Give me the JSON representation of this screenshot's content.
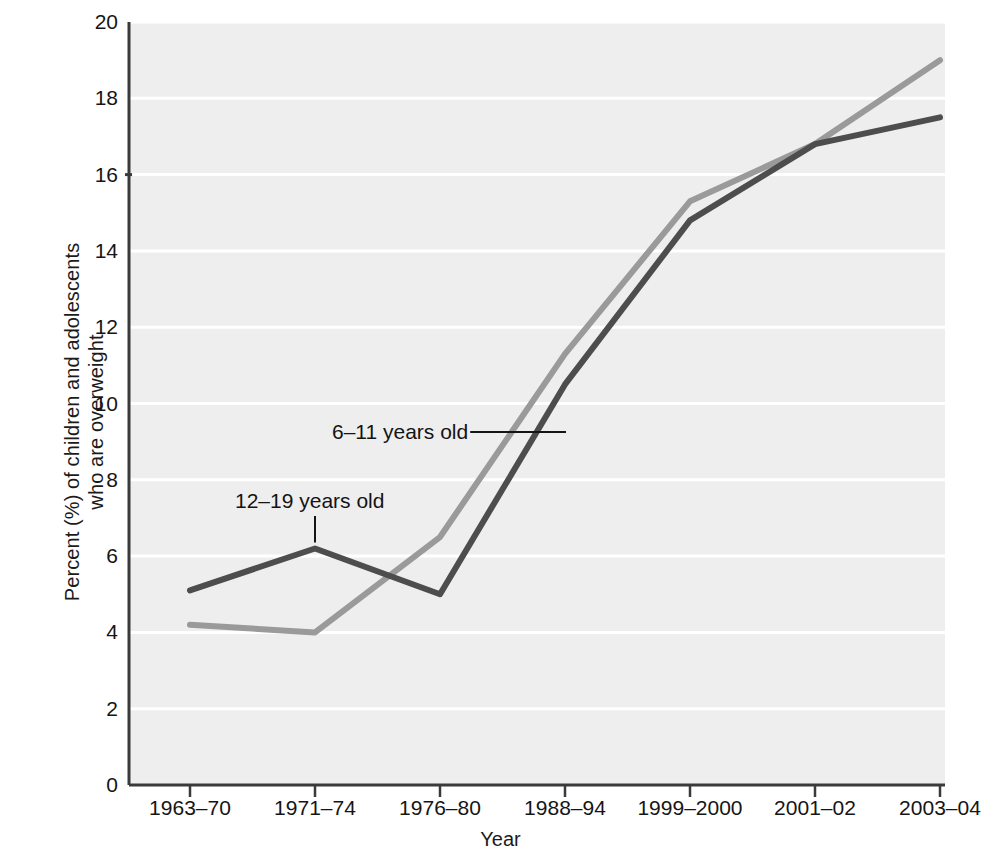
{
  "chart_data": {
    "type": "line",
    "title": "",
    "subtitle": "",
    "xlabel": "Year",
    "ylabel": "Percent (%) of children and adolescents who are overweight",
    "ylabel_line1": "Percent (%) of children and adolescents",
    "ylabel_line2": "who are overweight",
    "categories": [
      "1963–70",
      "1971–74",
      "1976–80",
      "1988–94",
      "1999–2000",
      "2001–02",
      "2003–04"
    ],
    "x": [
      "1963–70",
      "1971–74",
      "1976–80",
      "1988–94",
      "1999–2000",
      "2001–02",
      "2003–04"
    ],
    "series": [
      {
        "name": "6–11 years old",
        "color": "#9a9a9a",
        "values": [
          4.2,
          4.0,
          6.5,
          11.3,
          15.3,
          16.8,
          19.0
        ]
      },
      {
        "name": "12–19 years old",
        "color": "#4d4d4d",
        "values": [
          5.1,
          6.2,
          5.0,
          10.5,
          14.8,
          16.8,
          17.5
        ]
      }
    ],
    "yticks": [
      0,
      2,
      4,
      6,
      8,
      10,
      12,
      14,
      16,
      18,
      20
    ],
    "ytick_labels": [
      "0",
      "2",
      "4",
      "6",
      "8",
      "10",
      "12",
      "14",
      "16",
      "18",
      "20"
    ],
    "ylim": [
      0,
      20
    ],
    "grid": "horizontal",
    "legend_position": "inline-annotations",
    "annotations": [
      {
        "text": "6–11 years old",
        "points_to_series": "6–11 years old",
        "leader": "horizontal-right"
      },
      {
        "text": "12–19 years old",
        "points_to_series": "12–19 years old",
        "leader": "vertical-down"
      }
    ],
    "plot_background": "#eeeeee",
    "gridline_color": "#ffffff",
    "axis_color": "#3a3a3a"
  }
}
